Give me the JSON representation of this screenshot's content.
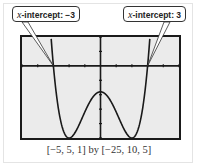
{
  "callouts": [
    {
      "var": "x",
      "label": "-intercept: −3"
    },
    {
      "var": "x",
      "label": "-intercept: 3"
    }
  ],
  "caption": "[−5, 5, 1] by [−25, 10, 5]",
  "colors": {
    "screen_bg": "#ebebeb",
    "curve": "#1a1a1a",
    "frame_border": "#e4e4e4"
  },
  "chart_data": {
    "type": "line",
    "title": "",
    "function": "y = x^4 - 8x^2 - 9",
    "xlabel": "",
    "ylabel": "",
    "xlim": [
      -5,
      5
    ],
    "xscl": 1,
    "ylim": [
      -25,
      10
    ],
    "yscl": 5,
    "grid": false,
    "x": [
      -3.3,
      -3,
      -2.5,
      -2,
      -1.5,
      -1,
      -0.5,
      0,
      0.5,
      1,
      1.5,
      2,
      2.5,
      3,
      3.3
    ],
    "values": [
      21.5,
      0,
      -19.9,
      -25,
      -21.9,
      -16,
      -10.9,
      -9,
      -10.9,
      -16,
      -21.9,
      -25,
      -19.9,
      0,
      21.5
    ],
    "annotations": [
      {
        "text": "x-intercept: −3",
        "x": -3,
        "y": 0
      },
      {
        "text": "x-intercept: 3",
        "x": 3,
        "y": 0
      }
    ],
    "window_caption": "[−5, 5, 1] by [−25, 10, 5]"
  }
}
